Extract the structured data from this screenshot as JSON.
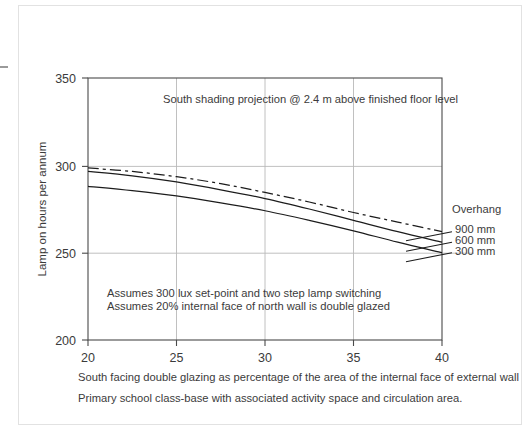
{
  "chart_data": {
    "type": "line",
    "title": "South shading projection @ 2.4 m above finished floor level",
    "xlabel": "South facing double glazing as percentage of the area of the internal face of external wall",
    "ylabel": "Lamp on hours per annum",
    "xlim": [
      20,
      40
    ],
    "ylim": [
      200,
      350
    ],
    "xticks": [
      20,
      25,
      30,
      35,
      40
    ],
    "yticks": [
      200,
      250,
      300,
      350
    ],
    "xtick_labels": [
      "20",
      "25",
      "30",
      "35",
      "40"
    ],
    "ytick_labels": [
      "200",
      "250",
      "300",
      "350"
    ],
    "grid": true,
    "legend_position": "right",
    "legend_title": "Overhang",
    "x": [
      20,
      22.5,
      25,
      27.5,
      30,
      32.5,
      35,
      37.5,
      40
    ],
    "series": [
      {
        "name": "900 mm",
        "style": "dash-dot",
        "values": [
          298.5,
          296.5,
          293.5,
          289.5,
          284.5,
          279.0,
          273.0,
          267.5,
          262.0
        ]
      },
      {
        "name": "600 mm",
        "style": "solid",
        "values": [
          296.5,
          294.0,
          290.5,
          286.0,
          281.0,
          275.0,
          268.5,
          262.0,
          256.0
        ]
      },
      {
        "name": "300 mm",
        "style": "solid",
        "values": [
          288.0,
          285.5,
          282.5,
          278.5,
          274.0,
          268.5,
          262.5,
          256.0,
          250.0
        ]
      }
    ],
    "annotations": [
      "Assumes 300 lux set-point and two step lamp switching",
      "Assumes 20% internal face of north wall is double glazed"
    ],
    "caption": "Primary school class-base with associated activity space and circulation area.",
    "line_color": "#1c1c1c",
    "grid_color": "#b9b9b9",
    "axis_color": "#4a4a4a",
    "text_color": "#3b3b3b"
  },
  "legend": {
    "title": "Overhang",
    "items": [
      {
        "label": "900 mm"
      },
      {
        "label": "600 mm"
      },
      {
        "label": "300 mm"
      }
    ]
  },
  "axis": {
    "y_title": "Lamp on hours per annum",
    "y_labels": [
      "350",
      "300",
      "250",
      "200"
    ],
    "x_labels": [
      "20",
      "25",
      "30",
      "35",
      "40"
    ]
  },
  "text": {
    "plot_title": "South shading projection @ 2.4 m above finished floor level",
    "note_line_1": "Assumes 300 lux set-point and two step lamp switching",
    "note_line_2": "Assumes 20% internal face of north wall is double glazed",
    "caption_line_1": "South facing double glazing as percentage of the area of the internal face of external wall",
    "caption_line_2": "Primary school class-base with associated activity space and circulation area."
  }
}
